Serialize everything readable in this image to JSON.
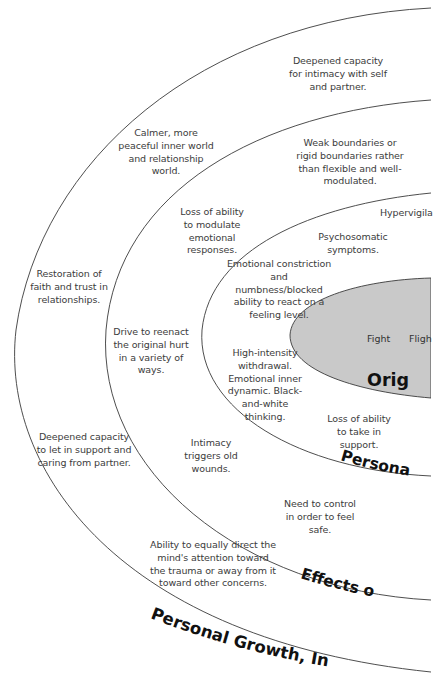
{
  "diagram": {
    "rings": [
      {
        "id": "growth",
        "label": "Personal Growth, In",
        "notes": [
          "Deepened capacity for intimacy with self and partner.",
          "Calmer, more peaceful inner world and relationship world.",
          "Restoration of faith and trust in relationships.",
          "Deepened capacity to let in support and caring from partner.",
          "Ability to equally direct the mind's attention toward the trauma or away from it toward other concerns."
        ]
      },
      {
        "id": "effects",
        "label": "Effects o",
        "notes": [
          "Weak boundaries or rigid boundaries rather than flexible and well-modulated.",
          "Loss of ability to modulate emotional responses.",
          "Drive to reenact the original hurt in a variety of ways.",
          "Intimacy triggers old wounds.",
          "Need to control in order to feel safe."
        ]
      },
      {
        "id": "personal",
        "label": "Persona",
        "notes": [
          "Hypervigila",
          "Psychosomatic symptoms.",
          "Emotional constriction and numbness/blocked ability to react on a feeling level.",
          "High-intensity withdrawal. Emotional inner dynamic. Black-and-white thinking.",
          "Loss of ability to take in support."
        ]
      },
      {
        "id": "origin",
        "label": "Orig",
        "words": [
          "Fight",
          "Fligh"
        ]
      }
    ],
    "colors": {
      "line": "#3a3a3a",
      "core_fill": "#c9c9c9",
      "text": "#3c3c3c",
      "label": "#111111"
    }
  }
}
